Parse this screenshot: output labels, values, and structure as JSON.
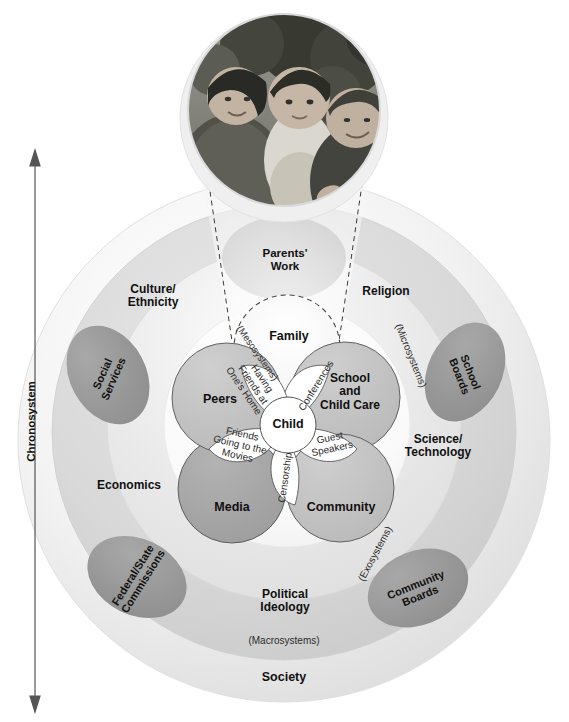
{
  "diagram": {
    "photo": {
      "caption_label": "family-photo",
      "description": "Black and white photograph of a mother holding a toddler beside a grandmother outdoors"
    },
    "timeline": {
      "label": "Chronosystem",
      "arrow": "double-headed-vertical-arrow"
    },
    "rings": {
      "society": "Society",
      "macro": "(Macrosystems)",
      "exo": "(Exosystems)",
      "meso": "(Mesosystems)",
      "micro": "(Microsystems)"
    },
    "microsystems": [
      {
        "key": "family",
        "label": "Family",
        "shade": "highlight",
        "dashed": true
      },
      {
        "key": "school",
        "label": "School\nand\nChild Care",
        "shade": "mid",
        "dashed": false
      },
      {
        "key": "community",
        "label": "Community",
        "shade": "mid",
        "dashed": false
      },
      {
        "key": "media",
        "label": "Media",
        "shade": "dark",
        "dashed": false
      },
      {
        "key": "peers",
        "label": "Peers",
        "shade": "mid",
        "dashed": false
      }
    ],
    "microsystem_labels": {
      "family": "Family",
      "school_line1": "School",
      "school_line2": "and",
      "school_line3": "Child Care",
      "community": "Community",
      "media": "Media",
      "peers": "Peers"
    },
    "center": {
      "label": "Child"
    },
    "mesosystem_petals": [
      {
        "key": "conferences",
        "label": "Conferences"
      },
      {
        "key": "guest",
        "label": "Guest\nSpeakers"
      },
      {
        "key": "censorship",
        "label": "Censorship"
      },
      {
        "key": "movies",
        "label": "Friends\nGoing to the\nMovies"
      },
      {
        "key": "home",
        "label": "Having\nFriends at\nOne's Home"
      }
    ],
    "mesosystem_labels": {
      "conferences": "Conferences",
      "guest_line1": "Guest",
      "guest_line2": "Speakers",
      "censorship": "Censorship",
      "movies_line1": "Friends",
      "movies_line2": "Going to the",
      "movies_line3": "Movies",
      "home_line1": "Having",
      "home_line2": "Friends at",
      "home_line3": "One's Home"
    },
    "exosystem_items": [
      {
        "key": "parents_work",
        "label": "Parents'\nWork"
      },
      {
        "key": "social_services",
        "label": "Social\nServices"
      },
      {
        "key": "school_boards",
        "label": "School\nBoards"
      },
      {
        "key": "federal_state",
        "label": "Federal/State\nCommissions"
      },
      {
        "key": "community_boards",
        "label": "Community\nBoards"
      }
    ],
    "exosystem_labels": {
      "parents_work_line1": "Parents'",
      "parents_work_line2": "Work",
      "social_services_line1": "Social",
      "social_services_line2": "Services",
      "school_boards_line1": "School",
      "school_boards_line2": "Boards",
      "federal_state_line1": "Federal/State",
      "federal_state_line2": "Commissions",
      "community_boards_line1": "Community",
      "community_boards_line2": "Boards"
    },
    "macrosystem_items": [
      {
        "key": "culture",
        "label": "Culture/\nEthnicity"
      },
      {
        "key": "religion",
        "label": "Religion"
      },
      {
        "key": "science",
        "label": "Science/\nTechnology"
      },
      {
        "key": "economics",
        "label": "Economics"
      },
      {
        "key": "political",
        "label": "Political\nIdeology"
      }
    ],
    "macrosystem_labels": {
      "culture_line1": "Culture/",
      "culture_line2": "Ethnicity",
      "religion": "Religion",
      "science_line1": "Science/",
      "science_line2": "Technology",
      "economics": "Economics",
      "political_line1": "Political",
      "political_line2": "Ideology"
    }
  },
  "colors": {
    "society_ring": "#ebebeb",
    "macro_ring": "#d8d8d8",
    "exo_ring": "#e3e3e3",
    "micro_mid": "#c3c3c3",
    "micro_dark": "#a9a9a9",
    "blob_dark": "#9a9a9a",
    "petal_white": "#ffffff",
    "outline": "#4a4a4a",
    "text": "#111111"
  }
}
